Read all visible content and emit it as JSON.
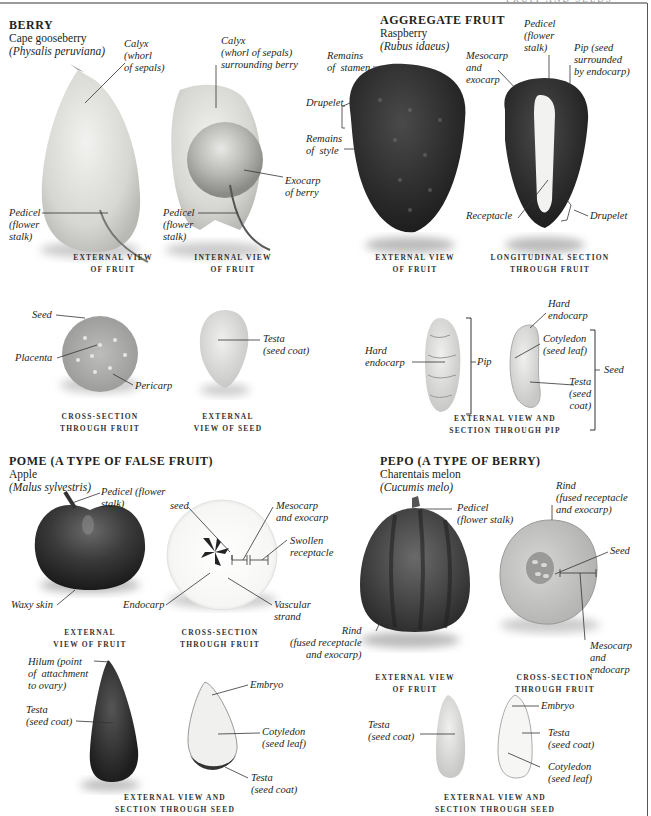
{
  "running_head": "FRUIT AND SEEDS",
  "sections": {
    "berry": {
      "title": "BERRY",
      "common_name": "Cape gooseberry",
      "scientific_name": "(Physalis peruviana)",
      "labels": {
        "calyx_ext": "Calyx\n(whorl\nof sepals)",
        "calyx_int": "Calyx\n(whorl of sepals)\nsurrounding berry",
        "pedicel_ext": "Pedicel\n(flower\nstalk)",
        "pedicel_int": "Pedicel\n(flower\nstalk)",
        "exocarp": "Exocarp\nof berry",
        "seed": "Seed",
        "placenta": "Placenta",
        "pericarp": "Pericarp",
        "testa": "Testa\n(seed coat)"
      },
      "captions": {
        "external": "EXTERNAL VIEW\nOF FRUIT",
        "internal": "INTERNAL VIEW\nOF FRUIT",
        "cross": "CROSS-SECTION\nTHROUGH FRUIT",
        "seed": "EXTERNAL\nVIEW OF SEED"
      }
    },
    "aggregate": {
      "title": "AGGREGATE FRUIT",
      "common_name": "Raspberry",
      "scientific_name": "(Rubus idaeus)",
      "labels": {
        "stamen": "Remains\nof  stamen",
        "drupelet_ext": "Drupelet",
        "style": "Remains\nof  style",
        "mesocarp": "Mesocarp\nand\nexocarp",
        "pedicel": "Pedicel\n(flower\nstalk)",
        "pip": "Pip (seed\nsurrounded\nby endocarp)",
        "receptacle": "Receptacle",
        "drupelet_sec": "Drupelet",
        "hard_endocarp_ext": "Hard\nendocarp",
        "pip_bracket": "Pip",
        "hard_endocarp_sec": "Hard\nendocarp",
        "cotyledon": "Cotyledon\n(seed leaf)",
        "testa": "Testa\n(seed\ncoat)",
        "seed_bracket": "Seed"
      },
      "captions": {
        "external": "EXTERNAL VIEW\nOF FRUIT",
        "longitudinal": "LONGITUDINAL SECTION\nTHROUGH FRUIT",
        "pip": "EXTERNAL VIEW AND\nSECTION THROUGH PIP"
      }
    },
    "pome": {
      "title": "POME (A TYPE OF FALSE FRUIT)",
      "common_name": "Apple",
      "scientific_name": "(Malus sylvestris)",
      "labels": {
        "pedicel": "Pedicel (flower\nstalk)",
        "waxy": "Waxy skin",
        "seed": "seed",
        "mesocarp": "Mesocarp\nand exocarp",
        "swollen": "Swollen\nreceptacle",
        "endocarp": "Endocarp",
        "vascular": "Vascular\nstrand",
        "hilum": "Hilum (point\nof  attachment\nto ovary)",
        "testa_ext": "Testa\n(seed coat)",
        "embryo": "Embryo",
        "cotyledon": "Cotyledon\n(seed leaf)",
        "testa_sec": "Testa\n(seed coat)"
      },
      "captions": {
        "external": "EXTERNAL\nVIEW OF FRUIT",
        "cross": "CROSS-SECTION\nTHROUGH FRUIT",
        "seed": "EXTERNAL VIEW AND\nSECTION THROUGH SEED"
      }
    },
    "pepo": {
      "title": "PEPO (A TYPE OF BERRY)",
      "common_name": "Charentais melon",
      "scientific_name": "(Cucumis melo)",
      "labels": {
        "pedicel": "Pedicel\n(flower stalk)",
        "rind_top": "Rind\n(fused receptacle\nand exocarp)",
        "seed": "Seed",
        "rind_ext": "Rind\n(fused receptacle\nand exocarp)",
        "mesocarp": "Mesocarp\nand\nendocarp",
        "testa_ext": "Testa\n(seed coat)",
        "embryo": "Embryo",
        "testa_sec": "Testa\n(seed coat)",
        "cotyledon": "Cotyledon\n(seed leaf)"
      },
      "captions": {
        "external": "EXTERNAL VIEW\nOF FRUIT",
        "cross": "CROSS-SECTION\nTHROUGH FRUIT",
        "seed": "EXTERNAL VIEW AND\nSECTION THROUGH SEED"
      }
    }
  }
}
